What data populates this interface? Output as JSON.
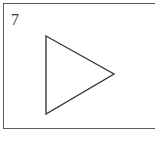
{
  "panel": {
    "label": "7",
    "background_color": "#ffffff",
    "border_color": "#555f63",
    "border_width_px": 1,
    "frame": {
      "x": 3,
      "y": 3,
      "width": 168,
      "height": 126,
      "right_edge_clipped": true
    }
  },
  "figure": {
    "shape_name": "triangle",
    "orientation": "right-pointing",
    "fill": "none",
    "stroke_color": "#3a3a3a",
    "stroke_width_px": 1.4,
    "vertices": [
      {
        "x": 46,
        "y": 36
      },
      {
        "x": 114,
        "y": 74
      },
      {
        "x": 46,
        "y": 114
      }
    ],
    "points_attr": "46,36 114,74 46,114"
  },
  "image": {
    "width": 155,
    "height": 144
  }
}
